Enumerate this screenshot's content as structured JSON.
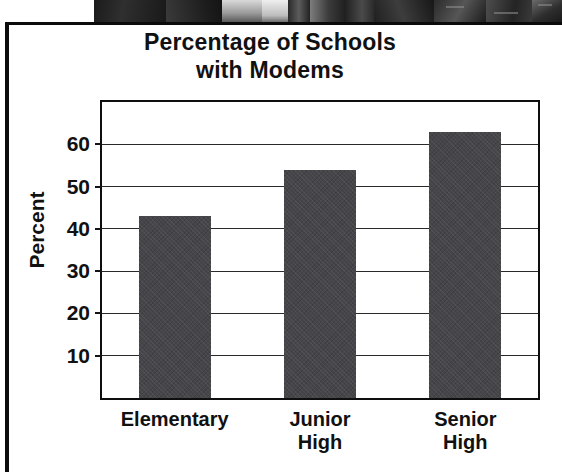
{
  "photo": {
    "caption": "grayscale photo fragment strip"
  },
  "chart_data": {
    "type": "bar",
    "title": "Percentage of Schools\nwith Modems",
    "xlabel": "",
    "ylabel": "Percent",
    "categories": [
      "Elementary",
      "Junior\nHigh",
      "Senior\nHigh"
    ],
    "values": [
      43,
      54,
      63
    ],
    "ylim": [
      0,
      70
    ],
    "yticks": [
      10,
      20,
      30,
      40,
      50,
      60
    ],
    "ytick_labels": [
      "10",
      "20",
      "30",
      "40",
      "50",
      "60"
    ],
    "grid": true,
    "legend": "none",
    "bar_color": "#46464a",
    "axis_color": "#0e0e0e",
    "background": "#ffffff"
  }
}
